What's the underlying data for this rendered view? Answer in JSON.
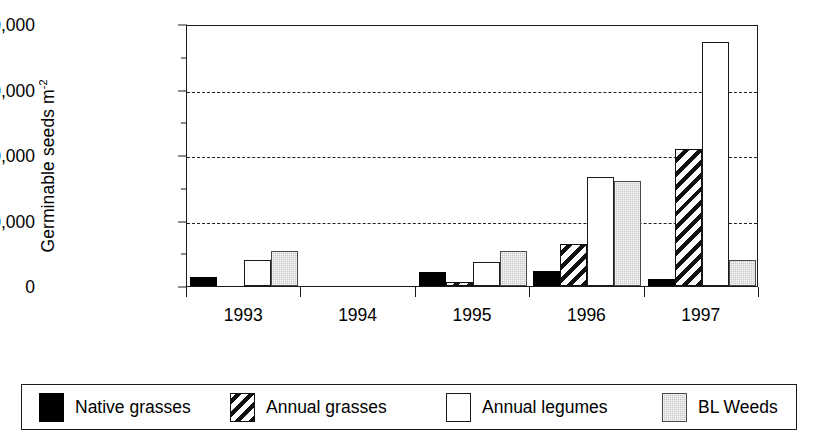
{
  "chart_data": {
    "type": "bar",
    "title": "",
    "xlabel": "",
    "ylabel": "Germinable seeds m",
    "ylabel_sup": "-2",
    "categories": [
      "1993",
      "1994",
      "1995",
      "1996",
      "1997"
    ],
    "ylim": [
      0,
      40000
    ],
    "yticks": [
      0,
      10000,
      20000,
      30000,
      40000
    ],
    "ytick_labels": [
      "0",
      "10,000",
      "20,000",
      "30,000",
      "40,000"
    ],
    "grid": "horizontal-dashed",
    "legend_position": "bottom",
    "series": [
      {
        "name": "Native grasses",
        "swatch": "solid-black",
        "color": "#000000",
        "values": [
          1400,
          0,
          2200,
          2300,
          1000
        ]
      },
      {
        "name": "Annual grasses",
        "swatch": "diagonal-hatch",
        "color": "#111111",
        "values": [
          0,
          0,
          600,
          6400,
          20900
        ]
      },
      {
        "name": "Annual legumes",
        "swatch": "white-outline",
        "color": "#ffffff",
        "values": [
          3900,
          0,
          3700,
          16600,
          37300
        ]
      },
      {
        "name": "BL Weeds",
        "swatch": "gray-fill",
        "color": "#c8c8c8",
        "values": [
          5400,
          0,
          5300,
          16100,
          4000
        ]
      }
    ]
  }
}
